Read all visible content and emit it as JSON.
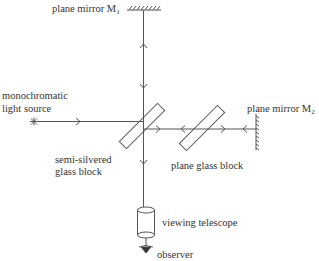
{
  "diagram": {
    "labels": {
      "mirror1": "plane mirror M",
      "mirror1_sub": "1",
      "mirror2": "plane mirror M",
      "mirror2_sub": "2",
      "source_line1": "monochromatic",
      "source_line2": "light source",
      "splitter_line1": "semi-silvered",
      "splitter_line2": "glass block",
      "compensator": "plane glass block",
      "telescope": "viewing telescope",
      "observer": "observer"
    },
    "colors": {
      "line": "#555555",
      "text": "#333333",
      "background": "#ffffff"
    }
  }
}
